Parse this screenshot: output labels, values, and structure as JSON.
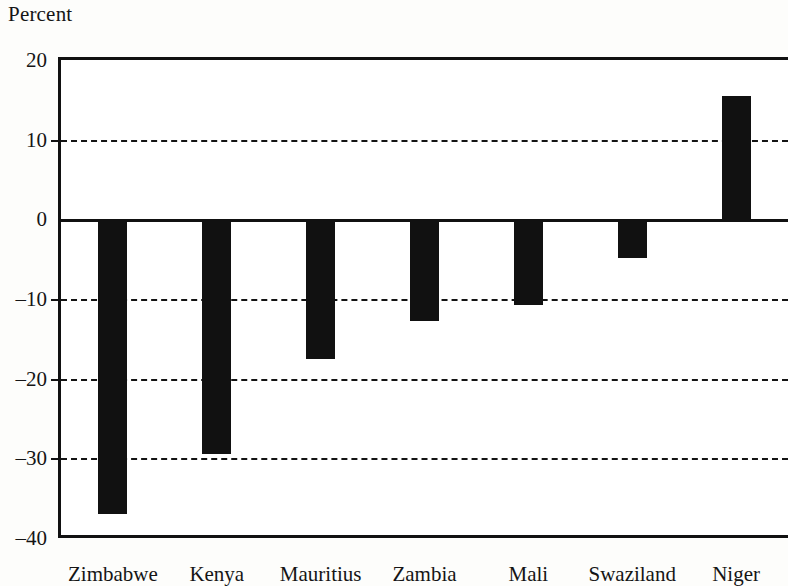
{
  "chart_data": {
    "type": "bar",
    "title": "",
    "ylabel": "Percent",
    "xlabel": "",
    "categories": [
      "Zimbabwe",
      "Kenya",
      "Mauritius",
      "Zambia",
      "Mali",
      "Swaziland",
      "Niger"
    ],
    "values": [
      -37,
      -29.5,
      -17.5,
      -12.7,
      -10.7,
      -4.8,
      15.5
    ],
    "ylim": [
      -40,
      20
    ],
    "yticks": [
      20,
      10,
      0,
      -10,
      -20,
      -30,
      -40
    ],
    "ytick_labels": [
      "20",
      "10",
      "0",
      "–10",
      "–20",
      "–30",
      "–40"
    ],
    "gridlines": [
      10,
      -10,
      -20,
      -30
    ],
    "grid": "horizontal-dashed",
    "legend": "none",
    "bar_color": "#111111",
    "axis_color": "#111111",
    "background": "#ffffff"
  },
  "axis_title": "Percent",
  "y_axis": {
    "ticks": [
      {
        "value": 20,
        "label": "20"
      },
      {
        "value": 10,
        "label": "–10_placeholder"
      },
      {
        "value": 0,
        "label": "0"
      },
      {
        "value": -10,
        "label": "–10"
      },
      {
        "value": -20,
        "label": "–20"
      },
      {
        "value": -30,
        "label": "–30"
      },
      {
        "value": -40,
        "label": "–40"
      }
    ]
  }
}
